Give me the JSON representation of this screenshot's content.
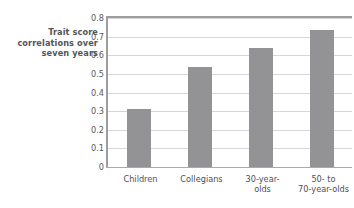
{
  "chart_data": {
    "type": "bar",
    "title": "",
    "subtitle": "",
    "xlabel": "",
    "ylabel": "Trait score correlations over seven years",
    "ylabel_lines": [
      "Trait score",
      "correlations over",
      "seven years"
    ],
    "categories": [
      "Children",
      "Collegians",
      "30-year-olds",
      "50- to 70-year-olds"
    ],
    "category_label_lines": [
      [
        "Children"
      ],
      [
        "Collegians"
      ],
      [
        "30-year-",
        "olds"
      ],
      [
        "50- to",
        "70-year-olds"
      ]
    ],
    "values": [
      0.31,
      0.535,
      0.64,
      0.735
    ],
    "ylim": [
      0,
      0.8
    ],
    "ytick_values": [
      0,
      0.1,
      0.2,
      0.3,
      0.4,
      0.5,
      0.6,
      0.7,
      0.8
    ],
    "ytick_labels": [
      "0",
      "0.1",
      "0.2",
      "0.3",
      "0.4",
      "0.5",
      "0.6",
      "0.7",
      "0.8"
    ],
    "grid": true,
    "grid_axis": "y",
    "legend": false,
    "legend_position": "none",
    "bar_color": "#939395",
    "gridline_color": "#d6d6d8",
    "axis_color": "#9d9d9f",
    "text_color": "#4f4f51",
    "background_color": "#ffffff"
  }
}
